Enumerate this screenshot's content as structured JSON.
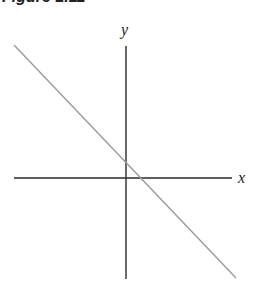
{
  "figure": {
    "caption": "Figure 1.11"
  },
  "diagram": {
    "type": "coordinate-axes-with-line",
    "axes": {
      "x_label": "x",
      "y_label": "y",
      "color": "#2a2a2a"
    },
    "line": {
      "description": "straight line with negative slope, small positive y-intercept and small positive x-intercept",
      "color": "#9a9a9a"
    }
  }
}
